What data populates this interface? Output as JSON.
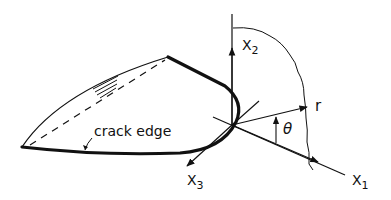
{
  "diagram": {
    "labels": {
      "crack_edge": "crack edge",
      "x1": "X",
      "x1_sub": "1",
      "x2": "X",
      "x2_sub": "2",
      "x3": "X",
      "x3_sub": "3",
      "r": "r",
      "theta": "θ"
    },
    "colors": {
      "stroke": "#111111",
      "background": "#ffffff"
    }
  }
}
